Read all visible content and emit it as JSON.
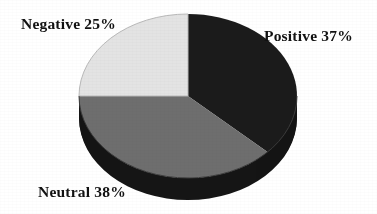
{
  "chart_data": {
    "type": "pie",
    "title": "",
    "subtitle": "",
    "xlabel": "",
    "ylabel": "",
    "legend_position": "none",
    "grid": false,
    "style": "3d-pie",
    "background_color": "#ffffff",
    "center": {
      "x": 188,
      "y": 96
    },
    "radius_x": 109,
    "radius_y": 82,
    "depth": 22,
    "start_angle_deg": 0,
    "direction": "clockwise",
    "categories": [
      "Positive",
      "Neutral",
      "Negative"
    ],
    "values": [
      37,
      38,
      25
    ],
    "unit": "%",
    "slices": [
      {
        "name": "Positive",
        "value": 37,
        "label": "Positive 37%",
        "color": "#1b1b1b",
        "side_color": "#151515",
        "start_deg": 0,
        "end_deg": 133.2
      },
      {
        "name": "Neutral",
        "value": 38,
        "label": "Neutral 38%",
        "color": "#6e6e6e",
        "side_color": "#262626",
        "start_deg": 133.2,
        "end_deg": 270.0
      },
      {
        "name": "Negative",
        "value": 25,
        "label": "Negative 25%",
        "color": "#e3e3e3",
        "side_color": "#2a2a2a",
        "start_deg": 270.0,
        "end_deg": 360.0
      }
    ],
    "annotations": [
      {
        "name": "negative-label",
        "text": "Negative 25%",
        "x": 21,
        "y": 16
      },
      {
        "name": "positive-label",
        "text": "Positive 37%",
        "x": 264,
        "y": 28
      },
      {
        "name": "neutral-label",
        "text": "Neutral 38%",
        "x": 38,
        "y": 184
      }
    ]
  },
  "labels": {
    "positive": "Positive 37%",
    "neutral": "Neutral 38%",
    "negative": "Negative 25%"
  },
  "colors": {
    "positive": "#1b1b1b",
    "neutral": "#6e6e6e",
    "negative": "#e3e3e3",
    "rim": "#1a1a1a",
    "background": "#ffffff",
    "text": "#111111"
  }
}
